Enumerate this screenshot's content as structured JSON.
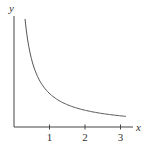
{
  "chart_data": {
    "type": "line",
    "title": "",
    "xlabel": "x",
    "ylabel": "y",
    "x_ticks": [
      "1",
      "2",
      "3"
    ],
    "xlim": [
      0,
      3.5
    ],
    "grid": false,
    "legend": null,
    "series": [
      {
        "name": "y = 1/x (decreasing curve)",
        "x": [
          0.31,
          0.4,
          0.5,
          0.6,
          0.75,
          1.0,
          1.25,
          1.5,
          2.0,
          2.5,
          3.0,
          3.15
        ],
        "y": [
          3.23,
          2.5,
          2.0,
          1.67,
          1.33,
          1.0,
          0.8,
          0.67,
          0.5,
          0.4,
          0.33,
          0.32
        ]
      }
    ]
  },
  "axes": {
    "x_label": "x",
    "y_label": "y",
    "ticks": [
      {
        "label": "1",
        "value": 1
      },
      {
        "label": "2",
        "value": 2
      },
      {
        "label": "3",
        "value": 3
      }
    ]
  }
}
